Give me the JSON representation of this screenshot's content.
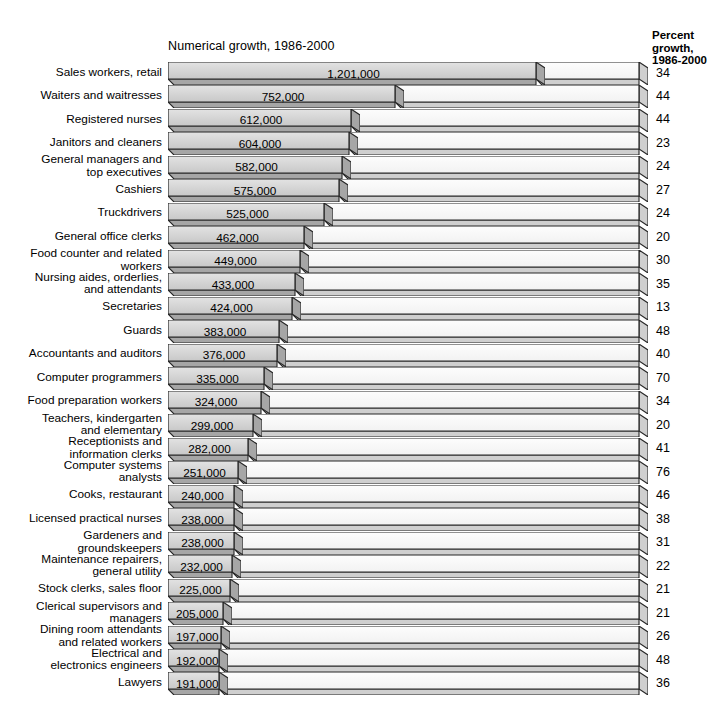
{
  "headers": {
    "numerical": "Numerical growth, 1986-2000",
    "percent_line1": "Percent",
    "percent_line2": "growth,",
    "percent_line3": "1986-2000"
  },
  "colors": {
    "bar_fill_gray": "#d9d9d9",
    "bar_fill_white": "#fbfbfb",
    "outline": "#2b2b2b",
    "shadow": "#9a9a9a",
    "background": "#ffffff"
  },
  "chart_data": {
    "type": "bar",
    "title": "Numerical growth, 1986-2000",
    "xlabel": "",
    "ylabel": "",
    "orientation": "horizontal",
    "grid": false,
    "legend": "none",
    "categories": [
      "Sales workers, retail",
      "Waiters and waitresses",
      "Registered nurses",
      "Janitors and cleaners",
      "General managers and\ntop executives",
      "Cashiers",
      "Truckdrivers",
      "General office clerks",
      "Food counter and related\nworkers",
      "Nursing aides, orderlies,\nand attendants",
      "Secretaries",
      "Guards",
      "Accountants and auditors",
      "Computer programmers",
      "Food preparation workers",
      "Teachers, kindergarten\nand elementary",
      "Receptionists and\ninformation clerks",
      "Computer systems\nanalysts",
      "Cooks, restaurant",
      "Licensed practical nurses",
      "Gardeners and\ngroundskeepers",
      "Maintenance repairers,\ngeneral utility",
      "Stock clerks, sales floor",
      "Clerical supervisors and\nmanagers",
      "Dining room attendants\nand related workers",
      "Electrical and\nelectronics engineers",
      "Lawyers"
    ],
    "series": [
      {
        "name": "Numerical growth, 1986-2000",
        "unit": "jobs",
        "labels": [
          "1,201,000",
          "752,000",
          "612,000",
          "604,000",
          "582,000",
          "575,000",
          "525,000",
          "462,000",
          "449,000",
          "433,000",
          "424,000",
          "383,000",
          "376,000",
          "335,000",
          "324,000",
          "299,000",
          "282,000",
          "251,000",
          "240,000",
          "238,000",
          "238,000",
          "232,000",
          "225,000",
          "205,000",
          "197,000",
          "192,000",
          "191,000"
        ],
        "values": [
          1201000,
          752000,
          612000,
          604000,
          582000,
          575000,
          525000,
          462000,
          449000,
          433000,
          424000,
          383000,
          376000,
          335000,
          324000,
          299000,
          282000,
          251000,
          240000,
          238000,
          238000,
          232000,
          225000,
          205000,
          197000,
          192000,
          191000
        ]
      },
      {
        "name": "Percent growth, 1986-2000",
        "unit": "percent",
        "labels": [
          "34",
          "44",
          "44",
          "23",
          "24",
          "27",
          "24",
          "20",
          "30",
          "35",
          "13",
          "48",
          "40",
          "70",
          "34",
          "20",
          "41",
          "76",
          "46",
          "38",
          "31",
          "22",
          "21",
          "21",
          "26",
          "48",
          "36"
        ],
        "values": [
          34,
          44,
          44,
          23,
          24,
          27,
          24,
          20,
          30,
          35,
          13,
          48,
          40,
          70,
          34,
          20,
          41,
          76,
          46,
          38,
          31,
          22,
          21,
          21,
          26,
          48,
          36
        ]
      }
    ]
  }
}
